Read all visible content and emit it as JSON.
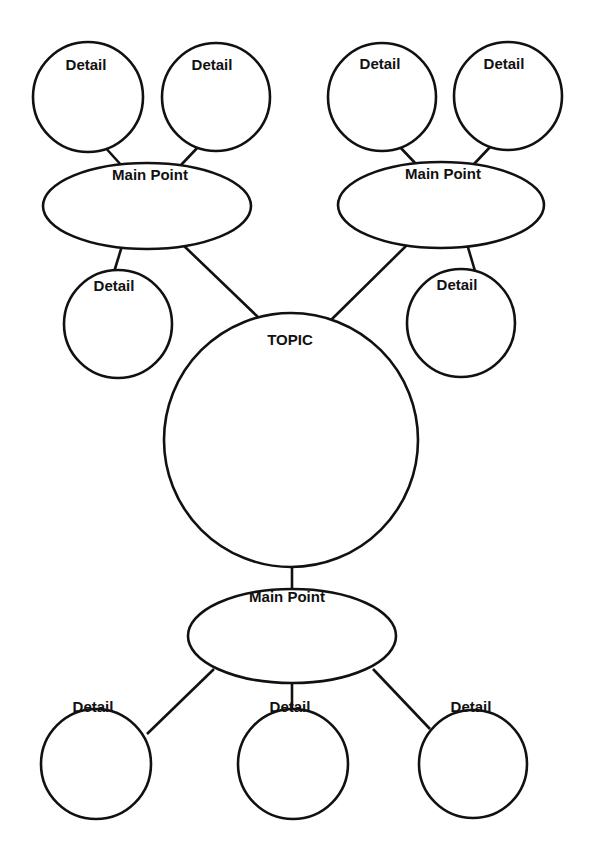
{
  "diagram": {
    "type": "bubble-map graphic organizer",
    "topic": {
      "label": "TOPIC"
    },
    "main_points": [
      {
        "label": "Main Point",
        "details": [
          "Detail",
          "Detail",
          "Detail"
        ]
      },
      {
        "label": "Main Point",
        "details": [
          "Detail",
          "Detail",
          "Detail"
        ]
      },
      {
        "label": "Main Point",
        "details": [
          "Detail",
          "Detail",
          "Detail"
        ]
      }
    ],
    "colors": {
      "stroke": "#111111",
      "background": "#ffffff"
    }
  }
}
